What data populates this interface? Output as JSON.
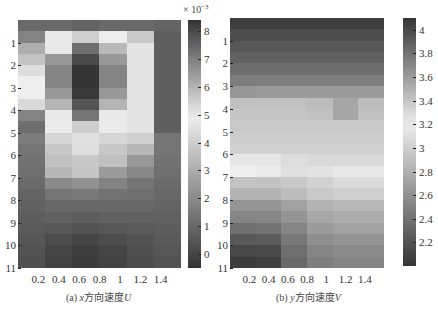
{
  "chart_data": [
    {
      "type": "heatmap",
      "title": "(a) x方向速度U",
      "caption_prefix": "(a) ",
      "caption_var": "x",
      "caption_text": "方向速度",
      "caption_sym": "U",
      "xlabel": "",
      "ylabel": "",
      "x_ticks": [
        "0.2",
        "0.4",
        "0.6",
        "0.8",
        "1",
        "1.2",
        "1.4"
      ],
      "x_tick_values": [
        0.2,
        0.4,
        0.6,
        0.8,
        1.0,
        1.2,
        1.4
      ],
      "y_ticks": [
        "1",
        "2",
        "3",
        "4",
        "5",
        "6",
        "7",
        "8",
        "9",
        "10",
        "11"
      ],
      "xlim": [
        0,
        1.6
      ],
      "ylim": [
        0,
        11
      ],
      "y_reversed": true,
      "colorbar": {
        "exponent_label": "× 10",
        "exponent": "−3",
        "ticks": [
          "8",
          "7",
          "6",
          "5",
          "4",
          "3",
          "2",
          "1",
          "0"
        ],
        "tick_values": [
          8,
          7,
          6,
          5,
          4,
          3,
          2,
          1,
          0
        ],
        "range": [
          -0.5,
          8.4
        ],
        "center": 4.9,
        "colormap": "gray-white-gray diverging"
      },
      "grid_cols": 6,
      "grid_rows": 22,
      "values": [
        [
          7.4,
          7.4,
          7.5,
          7.4,
          7.4,
          7.5
        ],
        [
          6.9,
          5.0,
          5.5,
          4.9,
          5.6,
          7.6
        ],
        [
          6.1,
          5.0,
          7.3,
          5.9,
          4.6,
          7.6
        ],
        [
          5.7,
          6.5,
          8.0,
          6.5,
          4.6,
          7.6
        ],
        [
          5.2,
          6.9,
          8.4,
          6.9,
          4.6,
          7.6
        ],
        [
          4.9,
          6.9,
          8.5,
          6.9,
          4.6,
          7.6
        ],
        [
          4.9,
          6.5,
          8.3,
          6.5,
          4.6,
          7.6
        ],
        [
          5.3,
          6.0,
          7.8,
          6.0,
          4.6,
          7.6
        ],
        [
          6.9,
          5.0,
          7.2,
          5.0,
          4.6,
          7.6
        ],
        [
          7.3,
          4.8,
          5.5,
          4.8,
          4.6,
          7.6
        ],
        [
          1.6,
          4.2,
          4.5,
          4.2,
          4.0,
          1.4
        ],
        [
          1.4,
          3.8,
          4.4,
          3.8,
          3.3,
          1.4
        ],
        [
          1.3,
          3.6,
          3.8,
          3.6,
          2.4,
          1.3
        ],
        [
          1.2,
          3.3,
          3.7,
          2.5,
          1.9,
          1.2
        ],
        [
          1.1,
          2.0,
          2.2,
          1.8,
          1.4,
          1.1
        ],
        [
          0.9,
          1.4,
          1.5,
          1.3,
          1.2,
          1.0
        ],
        [
          0.8,
          1.0,
          1.0,
          1.0,
          1.0,
          0.9
        ],
        [
          0.7,
          0.8,
          0.7,
          0.8,
          0.8,
          0.8
        ],
        [
          0.6,
          0.5,
          0.4,
          0.5,
          0.6,
          0.7
        ],
        [
          0.5,
          0.2,
          0.0,
          0.2,
          0.4,
          0.6
        ],
        [
          0.4,
          0.0,
          -0.2,
          0.0,
          0.3,
          0.5
        ],
        [
          0.3,
          -0.1,
          -0.3,
          -0.1,
          0.2,
          0.4
        ]
      ]
    },
    {
      "type": "heatmap",
      "title": "(b) y方向速度V",
      "caption_prefix": "(b) ",
      "caption_var": "y",
      "caption_text": "方向速度",
      "caption_sym": "V",
      "xlabel": "",
      "ylabel": "",
      "x_ticks": [
        "0.2",
        "0.4",
        "0.6",
        "0.8",
        "1",
        "1.2",
        "1.4"
      ],
      "x_tick_values": [
        0.2,
        0.4,
        0.6,
        0.8,
        1.0,
        1.2,
        1.4
      ],
      "y_ticks": [
        "1",
        "2",
        "3",
        "4",
        "5",
        "6",
        "7",
        "8",
        "9",
        "10",
        "11"
      ],
      "xlim": [
        0,
        1.6
      ],
      "ylim": [
        0,
        11
      ],
      "y_reversed": true,
      "colorbar": {
        "exponent_label": "",
        "exponent": "",
        "ticks": [
          "4",
          "3.8",
          "3.6",
          "3.4",
          "3.2",
          "3",
          "2.8",
          "2.6",
          "2.4",
          "2.2"
        ],
        "tick_values": [
          4.0,
          3.8,
          3.6,
          3.4,
          3.2,
          3.0,
          2.8,
          2.6,
          2.4,
          2.2
        ],
        "range": [
          2.0,
          4.1
        ],
        "center": 3.2,
        "colormap": "gray-white-gray diverging"
      },
      "grid_cols": 6,
      "grid_rows": 22,
      "values": [
        [
          4.05,
          4.05,
          4.05,
          4.05,
          4.05,
          4.05
        ],
        [
          3.98,
          3.98,
          3.98,
          3.98,
          3.98,
          3.98
        ],
        [
          3.93,
          3.93,
          3.93,
          3.93,
          3.93,
          3.93
        ],
        [
          3.88,
          3.88,
          3.88,
          3.88,
          3.88,
          3.88
        ],
        [
          3.82,
          3.82,
          3.82,
          3.82,
          3.82,
          3.82
        ],
        [
          3.74,
          3.74,
          3.74,
          3.74,
          3.74,
          3.74
        ],
        [
          3.62,
          3.6,
          3.6,
          3.6,
          3.6,
          3.6
        ],
        [
          3.42,
          3.42,
          3.42,
          3.44,
          3.55,
          3.44
        ],
        [
          3.4,
          3.4,
          3.4,
          3.42,
          3.55,
          3.42
        ],
        [
          3.38,
          3.38,
          3.38,
          3.38,
          3.38,
          3.38
        ],
        [
          3.36,
          3.36,
          3.36,
          3.36,
          3.36,
          3.36
        ],
        [
          3.34,
          3.34,
          3.34,
          3.34,
          3.34,
          3.34
        ],
        [
          3.24,
          3.24,
          3.28,
          3.3,
          3.3,
          3.3
        ],
        [
          3.2,
          3.18,
          3.1,
          3.12,
          3.16,
          3.16
        ],
        [
          2.92,
          2.92,
          2.96,
          3.02,
          3.08,
          3.08
        ],
        [
          2.82,
          2.82,
          2.88,
          2.96,
          3.0,
          3.0
        ],
        [
          2.62,
          2.62,
          2.7,
          2.82,
          2.86,
          2.86
        ],
        [
          2.52,
          2.52,
          2.62,
          2.74,
          2.78,
          2.78
        ],
        [
          2.38,
          2.4,
          2.52,
          2.66,
          2.7,
          2.7
        ],
        [
          2.24,
          2.26,
          2.44,
          2.58,
          2.62,
          2.62
        ],
        [
          2.12,
          2.14,
          2.38,
          2.52,
          2.56,
          2.56
        ],
        [
          2.05,
          2.08,
          2.34,
          2.48,
          2.52,
          2.52
        ]
      ]
    }
  ]
}
